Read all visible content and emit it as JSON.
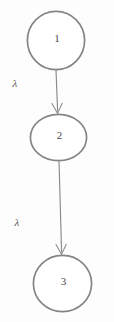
{
  "diagram": {
    "type": "state-transition-chain",
    "canvas": {
      "width": 114,
      "height": 322,
      "background": "#fdfdfd"
    },
    "stroke_color": "#808080",
    "text_color": "#4a4a4a",
    "nodes": [
      {
        "id": "node-1",
        "label": "1",
        "shape": "circle",
        "cx": 56,
        "cy": 40.5,
        "rx": 29,
        "ry": 29.5
      },
      {
        "id": "node-2",
        "label": "2",
        "shape": "ellipse",
        "cx": 58.5,
        "cy": 137.5,
        "rx": 28.5,
        "ry": 23.5
      },
      {
        "id": "node-3",
        "label": "3",
        "shape": "circle",
        "cx": 62.5,
        "cy": 283.5,
        "rx": 29.5,
        "ry": 28.5
      }
    ],
    "edges": [
      {
        "id": "edge-1-2",
        "from": "node-1",
        "to": "node-2",
        "label": "λ",
        "label_x": 15,
        "label_y": 83,
        "x1": 56,
        "y1": 70,
        "x2": 58,
        "y2": 113,
        "arrowhead": "open-v"
      },
      {
        "id": "edge-2-3",
        "from": "node-2",
        "to": "node-3",
        "label": "λ",
        "label_x": 17,
        "label_y": 222,
        "x1": 59,
        "y1": 161,
        "x2": 62,
        "y2": 254,
        "arrowhead": "open-v"
      }
    ]
  }
}
